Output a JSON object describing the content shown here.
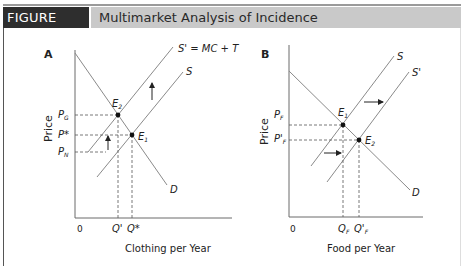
{
  "header": {
    "figure_label": "FIGURE 11.11",
    "title": "Multimarket Analysis of Incidence"
  },
  "panels": [
    {
      "id": "A",
      "panel_label": "A",
      "ylabel": "Price",
      "xlabel": "Clothing per Year",
      "origin": "0",
      "curves": {
        "supply": "S",
        "supply_shifted": "S' = MC + T",
        "demand": "D"
      },
      "points": {
        "e1": "E",
        "e1_sub": "1",
        "e2": "E",
        "e2_sub": "2"
      },
      "price_ticks": [
        {
          "main": "P",
          "sub": "G"
        },
        {
          "main": "P*",
          "sub": ""
        },
        {
          "main": "P",
          "sub": "N"
        }
      ],
      "quantity_ticks": [
        "Q'",
        "Q*"
      ],
      "shift_arrow": "up"
    },
    {
      "id": "B",
      "panel_label": "B",
      "ylabel": "Price",
      "xlabel": "Food per Year",
      "origin": "0",
      "curves": {
        "supply": "S",
        "supply_shifted": "S'",
        "demand": "D"
      },
      "points": {
        "e1": "E",
        "e1_sub": "1",
        "e2": "E",
        "e2_sub": "2"
      },
      "price_ticks": [
        {
          "main": "P",
          "sub": "F"
        },
        {
          "main": "P'",
          "sub": "F"
        }
      ],
      "quantity_ticks": [
        {
          "main": "Q",
          "sub": "F"
        },
        {
          "main": "Q'",
          "sub": "F"
        }
      ],
      "shift_arrow": "right"
    }
  ],
  "colors": {
    "header_dark": "#2e2e2e",
    "header_gray": "#c9c9c9",
    "curve": "#8a8a8a",
    "axis": "#6a6a6a",
    "dash": "#555555"
  }
}
